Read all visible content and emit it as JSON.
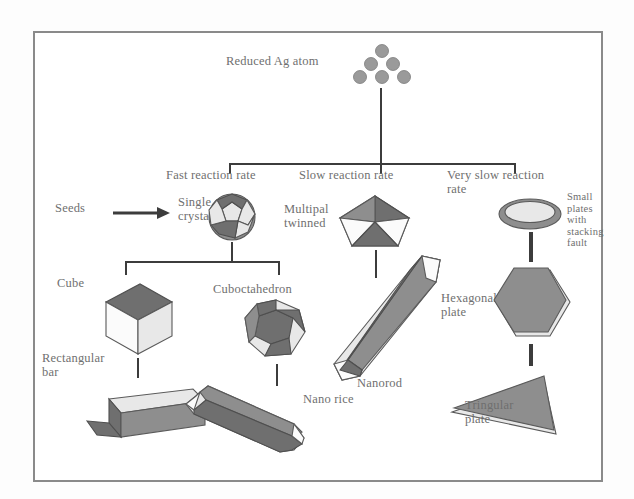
{
  "figure": {
    "root_label": "Reduced Ag atom",
    "seeds_label": "Seeds",
    "branches": [
      {
        "label": "Fast reaction rate"
      },
      {
        "label": "Slow reaction rate"
      },
      {
        "label": "Very slow reaction\nrate"
      }
    ],
    "nodes": {
      "single_crystal": "Single\ncrystal",
      "multipal_twinned": "Multipal\ntwinned",
      "small_plates": "Small\nplates\nwith\nstacking\nfault",
      "cube": "Cube",
      "cuboctahedron": "Cuboctahedron",
      "rectangular_bar": "Rectangular\nbar",
      "nano_rice": "Nano rice",
      "nanorod": "Nanorod",
      "hexagonal_plate": "Hexagonal\nplate",
      "tringular_plate": "Tringular\nplate"
    },
    "colors": {
      "border": "#8a8a8a",
      "line": "#4a4a4a",
      "text": "#6f6f6f",
      "shape_fill": "#8e8e8e",
      "shape_dark": "#6f6f6f",
      "shape_light": "#e8e8e8"
    },
    "atom_dots": 6
  }
}
